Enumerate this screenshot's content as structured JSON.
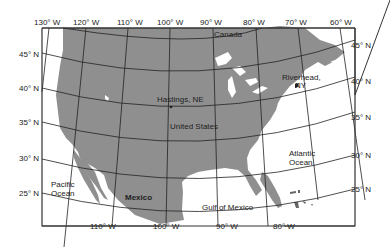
{
  "map": {
    "longitude_labels_top": [
      "130° W",
      "120° W",
      "110° W",
      "100° W",
      "90° W",
      "80° W",
      "70° W",
      "60° W"
    ],
    "longitude_labels_bottom": [
      "110° W",
      "100° W",
      "90° W",
      "80° W"
    ],
    "latitude_labels_left": [
      "45° N",
      "40° N",
      "35° N",
      "30° N",
      "25° N"
    ],
    "latitude_labels_right": [
      "45° N",
      "40° N",
      "35° N",
      "30° N",
      "25° N"
    ],
    "places": {
      "canada": "Canada",
      "united_states": "United States",
      "mexico": "Mexico",
      "hastings": "Hastings, NE",
      "riverhead_line1": "Riverhead,",
      "riverhead_line2": "NY",
      "pacific_line1": "Pacific",
      "pacific_line2": "Ocean",
      "atlantic_line1": "Atlantic",
      "atlantic_line2": "Ocean",
      "gulf": "Gulf of Mexico"
    },
    "colors": {
      "land": "#8f8f8f",
      "water": "#ffffff",
      "grid": "#222222",
      "frame": "#333333"
    }
  }
}
